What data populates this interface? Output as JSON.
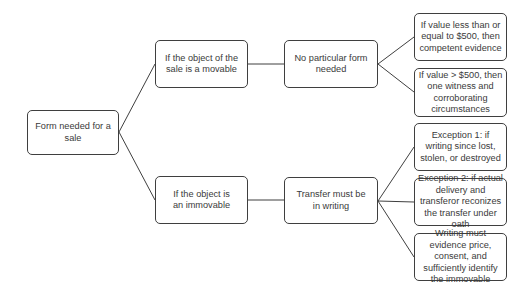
{
  "diagram": {
    "type": "tree",
    "orientation": "left-to-right",
    "colors": {
      "border": "#3f3f3f",
      "text": "#3a3a3a",
      "background": "#ffffff",
      "connector": "#3f3f3f"
    },
    "nodes": {
      "root": {
        "label": "Form needed for a sale"
      },
      "movable": {
        "label": "If the object of the sale is a movable"
      },
      "no_form": {
        "label": "No particular form needed"
      },
      "value_le_500": {
        "label": "If value less than or equal to $500, then competent evidence"
      },
      "value_gt_500": {
        "label": "If value > $500, then one witness and corroborating circumstances"
      },
      "immovable": {
        "label": "If the object is an immovable"
      },
      "transfer_writing": {
        "label": "Transfer must be in writing"
      },
      "exception_1": {
        "label": "Exception 1: if writing since lost, stolen, or destroyed"
      },
      "exception_2": {
        "label": "Exception 2: if actual delivery and transferor reconizes the transfer under oath"
      },
      "writing_evidence": {
        "label": "Writing must evidence price, consent, and sufficiently identify the immovable"
      }
    },
    "edges": [
      [
        "root",
        "movable"
      ],
      [
        "root",
        "immovable"
      ],
      [
        "movable",
        "no_form"
      ],
      [
        "no_form",
        "value_le_500"
      ],
      [
        "no_form",
        "value_gt_500"
      ],
      [
        "immovable",
        "transfer_writing"
      ],
      [
        "transfer_writing",
        "exception_1"
      ],
      [
        "transfer_writing",
        "exception_2"
      ],
      [
        "transfer_writing",
        "writing_evidence"
      ]
    ]
  }
}
